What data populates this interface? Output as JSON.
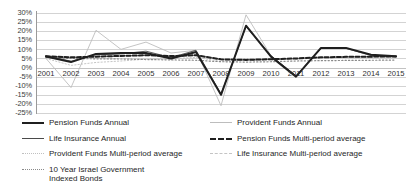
{
  "chart_data": {
    "type": "line",
    "title": "",
    "xlabel": "",
    "ylabel": "",
    "x": [
      2001,
      2002,
      2003,
      2004,
      2005,
      2006,
      2007,
      2008,
      2009,
      2010,
      2011,
      2012,
      2013,
      2014,
      2015
    ],
    "xticklabels": [
      "2001",
      "2002",
      "2003",
      "2004",
      "2005",
      "2006",
      "2007",
      "2008",
      "2009",
      "2010",
      "2011",
      "2012",
      "2013",
      "2014",
      "2015"
    ],
    "ylim": [
      -25,
      30
    ],
    "yticklabels": [
      "30%",
      "25%",
      "20%",
      "15%",
      "10%",
      "5%",
      "0%",
      "-5%",
      "-10%",
      "-15%",
      "-20%",
      "-25%"
    ],
    "ytickvalues": [
      30,
      25,
      20,
      15,
      10,
      5,
      0,
      -5,
      -10,
      -15,
      -20,
      -25
    ],
    "grid": true,
    "legend_position": "bottom",
    "series": [
      {
        "name": "Pension Funds Annual",
        "style": "solid-thick",
        "color": "#1f1f1f",
        "values": [
          6.0,
          3.0,
          7.5,
          8.0,
          8.0,
          5.0,
          8.5,
          -15.0,
          23.0,
          6.0,
          -5.0,
          10.8,
          10.8,
          7.0,
          6.2
        ]
      },
      {
        "name": "Life Insurance Annual",
        "style": "solid-thin",
        "color": "#4a4a4a",
        "values": [
          6.5,
          3.5,
          7.0,
          7.5,
          9.0,
          5.5,
          9.5,
          -14.5,
          22.5,
          6.5,
          -4.5,
          10.5,
          10.5,
          6.8,
          6.0
        ]
      },
      {
        "name": "Provident Funds Annual",
        "style": "solid-light",
        "color": "#bdbdbd",
        "values": [
          5.0,
          -11.0,
          20.5,
          10.0,
          14.0,
          8.0,
          9.5,
          -21.0,
          29.0,
          6.5,
          -5.0,
          10.5,
          10.5,
          6.5,
          6.0
        ]
      },
      {
        "name": "Pension Funds Multi-period average",
        "style": "dashed-thick",
        "color": "#1f1f1f",
        "values": [
          6.2,
          5.6,
          6.0,
          6.4,
          6.8,
          6.3,
          6.8,
          4.5,
          4.2,
          4.6,
          5.0,
          5.6,
          5.9,
          6.0,
          6.1
        ]
      },
      {
        "name": "Provident Funds Multi-period average",
        "style": "dotted-light",
        "color": "#c0c0c0",
        "values": [
          5.0,
          1.2,
          2.8,
          3.6,
          4.6,
          4.8,
          5.6,
          3.4,
          4.0,
          4.3,
          4.6,
          5.2,
          5.6,
          5.7,
          5.8
        ]
      },
      {
        "name": "Life Insurance Multi-period average",
        "style": "dashed-light",
        "color": "#c4c4c4",
        "values": [
          6.4,
          5.4,
          5.8,
          6.2,
          6.6,
          6.2,
          6.6,
          4.3,
          4.1,
          4.4,
          4.8,
          5.4,
          5.7,
          5.8,
          5.9
        ]
      },
      {
        "name": "10 Year Israel Government Indexed Bonds",
        "style": "dotted-fine",
        "color": "#8a8a8a",
        "values": [
          5.6,
          5.0,
          4.8,
          4.7,
          4.4,
          4.2,
          4.0,
          3.2,
          3.0,
          3.2,
          3.6,
          3.8,
          3.9,
          4.0,
          4.1
        ]
      }
    ]
  },
  "legend": {
    "items": [
      {
        "label": "Pension Funds Annual",
        "label2": "",
        "swatch": "sw-thick",
        "icon": "legend-line-solid-thick"
      },
      {
        "label": "Provident Funds Annual",
        "label2": "",
        "swatch": "sw-light",
        "icon": "legend-line-solid-light"
      },
      {
        "label": "Life Insurance Annual",
        "label2": "",
        "swatch": "sw-thin",
        "icon": "legend-line-solid-thin"
      },
      {
        "label": "Pension Funds Multi-period average",
        "label2": "",
        "swatch": "sw-thickdash",
        "icon": "legend-line-dashed-thick"
      },
      {
        "label": "Provident Funds Multi-period average",
        "label2": "",
        "swatch": "sw-lightdot",
        "icon": "legend-line-dotted-light"
      },
      {
        "label": "Life Insurance Multi-period average",
        "label2": "",
        "swatch": "sw-lightdash",
        "icon": "legend-line-dashed-light"
      },
      {
        "label": "10 Year Israel Government",
        "label2": "Indexed Bonds",
        "swatch": "sw-dotted",
        "icon": "legend-line-dotted-fine"
      }
    ]
  }
}
